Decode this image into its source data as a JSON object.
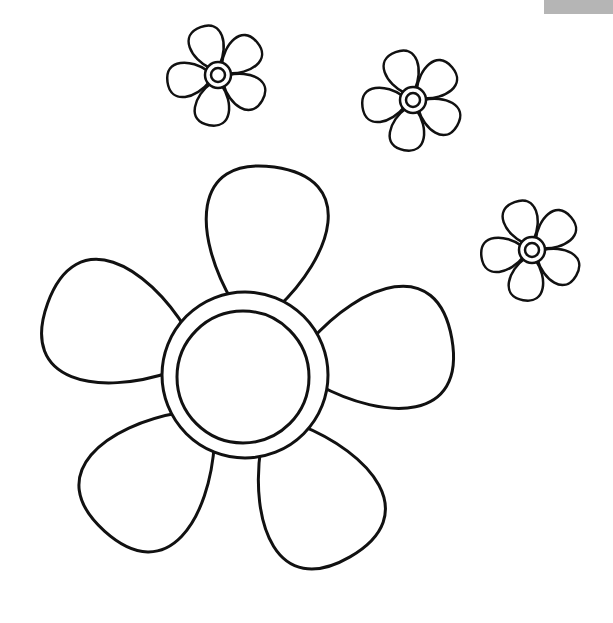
{
  "image": {
    "subject": "flower coloring page",
    "background": "#ffffff",
    "line_color": "#111111",
    "corner_tab_color": "#b5b5b5"
  },
  "flowers": [
    {
      "name": "large-flower",
      "cx": 245,
      "cy": 375,
      "petals": 5
    },
    {
      "name": "small-flower-1",
      "cx": 218,
      "cy": 75,
      "petals": 5
    },
    {
      "name": "small-flower-2",
      "cx": 413,
      "cy": 100,
      "petals": 5
    },
    {
      "name": "small-flower-3",
      "cx": 532,
      "cy": 250,
      "petals": 5
    }
  ]
}
